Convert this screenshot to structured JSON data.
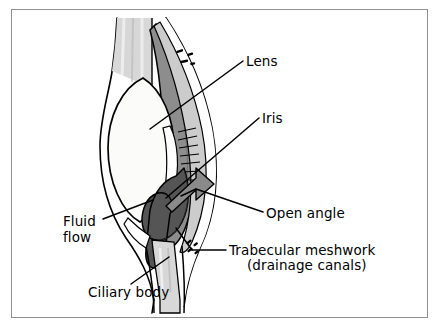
{
  "figure": {
    "border_color": "#8e9094",
    "background_color": "#ffffff"
  },
  "palette": {
    "outline": "#000000",
    "lens_fill": "#fbfbfa",
    "sclera_light": "#d2d2d2",
    "cornea_light": "#e2e2e2",
    "iris_mid": "#8d8d8d",
    "iris_dark": "#555555",
    "arrow_grey": "#8a8a8a",
    "band_grey": "#b4b4b4",
    "white": "#ffffff"
  },
  "labels": {
    "lens": "Lens",
    "iris": "Iris",
    "open_angle": "Open angle",
    "trabecular_line1": "Trabecular meshwork",
    "trabecular_line2": "(drainage canals)",
    "fluid_line1": "Fluid",
    "fluid_line2": "flow",
    "ciliary_body": "Ciliary body"
  },
  "structures": [
    {
      "name": "lens",
      "description": "Large white biconvex ellipse, left of centre"
    },
    {
      "name": "iris",
      "description": "Mid-grey band running top to bottom right of the lens"
    },
    {
      "name": "cornea",
      "description": "Outer curved light band on the right"
    },
    {
      "name": "sclera",
      "description": "Light grey striated band at top and bottom"
    },
    {
      "name": "ciliary-body",
      "description": "Light grey striated band at lower left of the angle"
    },
    {
      "name": "trabecular-meshwork",
      "description": "Comb-like hatch marks at the iridocorneal angle"
    },
    {
      "name": "angle-hook",
      "description": "Dark grey hook-shaped iris root enclosing the open angle"
    },
    {
      "name": "outflow-arrow",
      "description": "Grey arrow pointing right through the open angle"
    },
    {
      "name": "flow-dashes-upper",
      "description": "Three short dashes indicating aqueous flow, upper right"
    },
    {
      "name": "flow-dashes-lower",
      "description": "Four short dashes indicating aqueous flow, lower right"
    }
  ],
  "leader_lines": [
    {
      "name": "leader-lens",
      "from": [
        243,
        61
      ],
      "to": [
        150,
        129
      ]
    },
    {
      "name": "leader-iris",
      "from": [
        259,
        118
      ],
      "to": [
        168,
        196
      ]
    },
    {
      "name": "leader-open-angle",
      "from": [
        263,
        212
      ],
      "to": [
        196,
        190
      ]
    },
    {
      "name": "leader-trabecular",
      "from": [
        226,
        250
      ],
      "to": [
        193,
        250
      ]
    },
    {
      "name": "leader-fluid",
      "from": [
        102,
        219
      ],
      "to": [
        152,
        201
      ]
    },
    {
      "name": "leader-ciliary",
      "from": [
        130,
        285
      ],
      "to": [
        168,
        258
      ]
    }
  ]
}
